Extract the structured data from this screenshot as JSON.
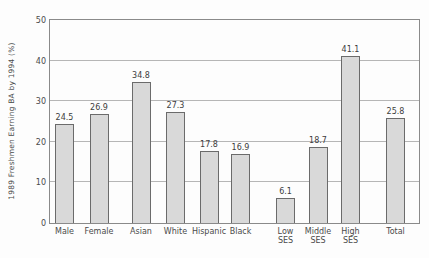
{
  "chart_data": {
    "type": "bar",
    "title": "",
    "xlabel": "",
    "ylabel": "1989 Freshmen Earning BA by 1994 (%)",
    "categories": [
      "Male",
      "Female",
      "Asian",
      "White",
      "Hispanic",
      "Black",
      "Low SES",
      "Middle SES",
      "High SES",
      "Total"
    ],
    "values": [
      24.5,
      26.9,
      34.8,
      27.3,
      17.8,
      16.9,
      6.1,
      18.7,
      41.1,
      25.8
    ],
    "value_labels": [
      "24.5",
      "26.9",
      "34.8",
      "27.3",
      "17.8",
      "16.9",
      "6.1",
      "18.7",
      "41.1",
      "25.8"
    ],
    "groups": [
      [
        "Male",
        "Female"
      ],
      [
        "Asian",
        "White",
        "Hispanic",
        "Black"
      ],
      [
        "Low SES",
        "Middle SES",
        "High SES"
      ],
      [
        "Total"
      ]
    ],
    "ylim": [
      0,
      50
    ],
    "yticks": [
      0,
      10,
      20,
      30,
      40,
      50
    ],
    "grid": "horizontal",
    "legend": "none",
    "colors": {
      "bar_fill": "#d9d9d9",
      "bar_border": "#6b6b6b",
      "grid": "#b6b6b6",
      "frame": "#8a8a8a",
      "text": "#3d3d3d"
    }
  }
}
